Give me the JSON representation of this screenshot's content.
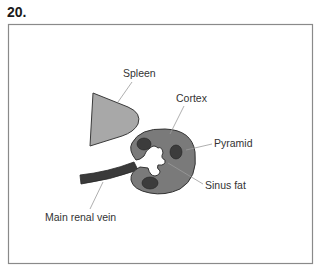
{
  "figure": {
    "number": "20."
  },
  "labels": {
    "spleen": "Spleen",
    "cortex": "Cortex",
    "pyramid": "Pyramid",
    "sinus_fat": "Sinus fat",
    "main_renal_vein": "Main renal vein"
  },
  "colors": {
    "frame": "#8a8a8a",
    "spleen_fill": "#a8a8a8",
    "spleen_stroke": "#3a3a3a",
    "cortex_fill": "#7a7a7a",
    "cortex_stroke": "#333333",
    "pyramid_fill": "#3c3c3c",
    "vein_fill": "#3a3a3a",
    "leader_line": "#9a9a9a",
    "sinus_fat": "#ffffff"
  }
}
